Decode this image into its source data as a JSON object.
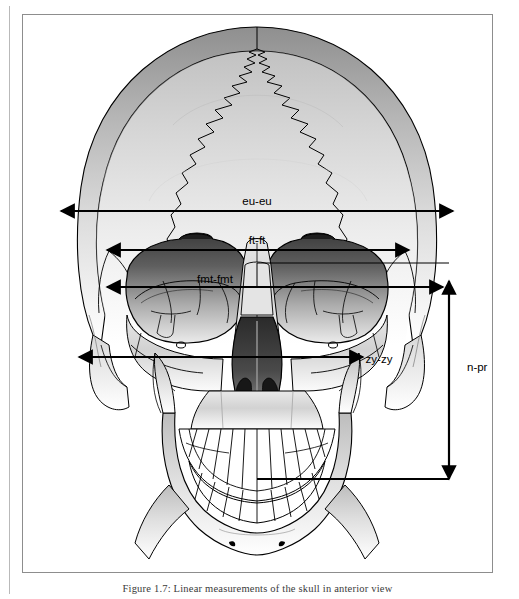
{
  "figure": {
    "caption": "Figure 1.7: Linear measurements of the skull in anterior view",
    "view": "anterior"
  },
  "measurements": [
    {
      "id": "eu-eu",
      "label": "eu-eu",
      "name": "maximum cranial breadth (euryon to euryon)",
      "orientation": "horizontal",
      "label_x": 258,
      "label_y": 185
    },
    {
      "id": "ft-ft",
      "label": "ft-ft",
      "name": "minimum frontal breadth (frontotemporale)",
      "orientation": "horizontal",
      "label_x": 258,
      "label_y": 224
    },
    {
      "id": "fmt-fmt",
      "label": "fmt-fmt",
      "name": "bifrontal breadth (frontomalare temporale)",
      "orientation": "horizontal",
      "label_x": 216,
      "label_y": 264
    },
    {
      "id": "zy-zy",
      "label": "zy-zy",
      "name": "bizygomatic breadth (zygion to zygion)",
      "orientation": "horizontal",
      "label_x": 380,
      "label_y": 356
    },
    {
      "id": "n-pr",
      "label": "n-pr",
      "name": "upper facial height (nasion to prosthion)",
      "orientation": "vertical",
      "label_x": 468,
      "label_y": 364
    }
  ],
  "colors": {
    "ink": "#000000",
    "frame": "#8d8d8d",
    "gutter": "#b9b9b9",
    "bone_light": "#ffffff",
    "bone_mid": "#c9c9c9",
    "bone_dark": "#6e6e6e",
    "orbit_dark": "#3a3a3a",
    "nasal_dark": "#2b2b2b",
    "caption_text": "#3a3a3a"
  },
  "anatomy": {
    "regions": [
      "cranial vault (frontal bone)",
      "coronal suture",
      "metopic line",
      "left orbit",
      "right orbit",
      "nasal aperture",
      "zygomatic arches",
      "maxilla with upper dentition",
      "mandible with lower dentition",
      "mental foramina"
    ]
  }
}
